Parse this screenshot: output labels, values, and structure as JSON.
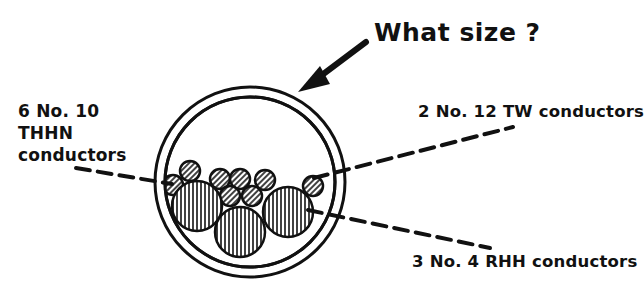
{
  "diagram": {
    "question": "What size ?",
    "labels": {
      "thhn": [
        "6 No. 10",
        "THHN",
        "conductors"
      ],
      "tw": "2 No. 12 TW conductors",
      "rhh": "3 No. 4 RHH conductors"
    },
    "conductor_groups": [
      {
        "count": 6,
        "size": "No. 10",
        "type": "THHN",
        "hatch": "diagonal"
      },
      {
        "count": 2,
        "size": "No. 12",
        "type": "TW",
        "hatch": "diagonal"
      },
      {
        "count": 3,
        "size": "No. 4",
        "type": "RHH",
        "hatch": "vertical"
      }
    ],
    "colors": {
      "ink": "#111111",
      "background": "#ffffff"
    }
  }
}
